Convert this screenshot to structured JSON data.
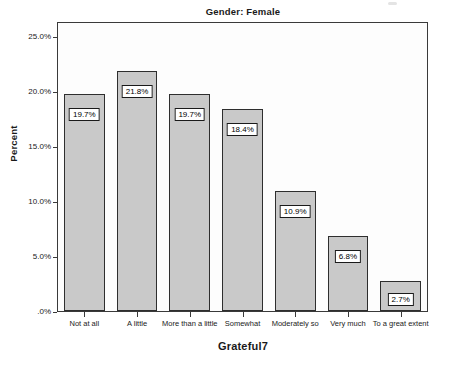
{
  "chart_data": {
    "type": "bar",
    "title": "Gender: Female",
    "xlabel": "Grateful7",
    "ylabel": "Percent",
    "categories": [
      "Not at all",
      "A little",
      "More than a little",
      "Somewhat",
      "Moderately so",
      "Very much",
      "To a great extent"
    ],
    "values": [
      19.7,
      21.8,
      19.7,
      18.4,
      10.9,
      6.8,
      2.7
    ],
    "value_labels": [
      "19.7%",
      "21.8%",
      "19.7%",
      "18.4%",
      "10.9%",
      "6.8%",
      "2.7%"
    ],
    "ylim": [
      0,
      25
    ],
    "y_ticks": [
      0,
      5,
      10,
      15,
      20,
      25
    ],
    "y_tick_labels": [
      ".0%",
      "5.0%",
      "10.0%",
      "15.0%",
      "20.0%",
      "25.0%"
    ],
    "grid": false,
    "legend": "none",
    "bar_color": "#c9c9c9",
    "bar_border_color": "#2e2e2e",
    "axis_color": "#3a3a3a",
    "plot_background": "#fdfdfd"
  }
}
